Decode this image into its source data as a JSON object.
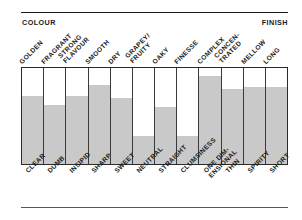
{
  "headings": {
    "left": "COLOUR",
    "right": "FINISH"
  },
  "chart_data": {
    "type": "bar",
    "title": "",
    "xlabel": "",
    "ylabel": "",
    "ylim": [
      0,
      100
    ],
    "grid": false,
    "legend": "none",
    "orientation": "vertical",
    "axis_note": "Paired semantic-differential scale: top label = positive pole, bottom label = negative pole",
    "categories": [
      "GOLDEN",
      "FRAGRANT",
      "STRONG FLAVOUR",
      "SMOOTH",
      "DRY",
      "GRAPEY/ FRUITY",
      "OAKY",
      "FINESSE",
      "COMPLEX",
      "CONCEN- TRATED",
      "MELLOW",
      "LONG"
    ],
    "categories_bottom": [
      "CLEAR",
      "DUMB",
      "INSIPID",
      "SHARP",
      "SWEET",
      "NEUTRAL",
      "STRAIGHT",
      "CLUMSINESS",
      "ONE DIM- ENSIONAL",
      "THIN",
      "SPIRITY",
      "SHORT"
    ],
    "values": [
      71,
      61,
      71,
      82,
      69,
      29,
      59,
      29,
      92,
      78,
      80,
      80
    ]
  },
  "top_labels": [
    {
      "line1": "GOLDEN",
      "line2": ""
    },
    {
      "line1": "FRAGRANT",
      "line2": ""
    },
    {
      "line1": "STRONG",
      "line2": "FLAVOUR"
    },
    {
      "line1": "SMOOTH",
      "line2": ""
    },
    {
      "line1": "DRY",
      "line2": ""
    },
    {
      "line1": "GRAPEY/",
      "line2": "FRUITY"
    },
    {
      "line1": "OAKY",
      "line2": ""
    },
    {
      "line1": "FINESSE",
      "line2": ""
    },
    {
      "line1": "COMPLEX",
      "line2": ""
    },
    {
      "line1": "CONCEN-",
      "line2": "TRATED"
    },
    {
      "line1": "MELLOW",
      "line2": ""
    },
    {
      "line1": "LONG",
      "line2": ""
    }
  ],
  "bottom_labels": [
    {
      "line1": "CLEAR",
      "line2": ""
    },
    {
      "line1": "DUMB",
      "line2": ""
    },
    {
      "line1": "INSIPID",
      "line2": ""
    },
    {
      "line1": "SHARP",
      "line2": ""
    },
    {
      "line1": "SWEET",
      "line2": ""
    },
    {
      "line1": "NEUTRAL",
      "line2": ""
    },
    {
      "line1": "STRAIGHT",
      "line2": ""
    },
    {
      "line1": "CLUMSINESS",
      "line2": ""
    },
    {
      "line1": "ONE DIM-",
      "line2": "ENSIONAL"
    },
    {
      "line1": "THIN",
      "line2": ""
    },
    {
      "line1": "SPIRITY",
      "line2": ""
    },
    {
      "line1": "SHORT",
      "line2": ""
    }
  ],
  "colors": {
    "bar_fill": "#c9c9c9",
    "bar_empty": "#ffffff",
    "frame": "#2b2b2b",
    "divider": "#3a3a3a",
    "rule": "#1a1a1a",
    "text": "#1a1a1a",
    "background": "#ffffff"
  }
}
